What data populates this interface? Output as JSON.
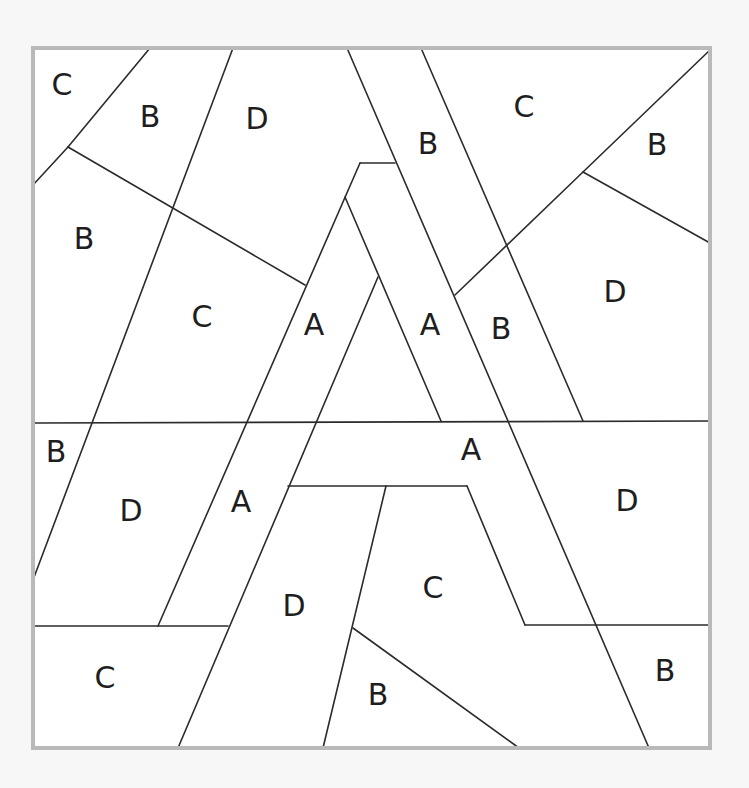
{
  "puzzle": {
    "title": "",
    "background": "#f7f7f7",
    "frame": {
      "x": 33,
      "y": 48,
      "width": 677,
      "height": 700,
      "fill": "#ffffff",
      "border_color": "#b9b9b9"
    },
    "line_color": "#2b2b2b",
    "segments": [
      [
        150,
        48,
        68,
        147
      ],
      [
        68,
        147,
        33,
        185
      ],
      [
        68,
        147,
        305,
        285
      ],
      [
        233,
        48,
        33,
        580
      ],
      [
        347,
        48,
        649,
        748
      ],
      [
        421,
        48,
        583,
        421
      ],
      [
        710,
        50,
        583,
        172
      ],
      [
        583,
        172,
        710,
        243
      ],
      [
        583,
        172,
        455,
        295
      ],
      [
        360,
        163,
        395,
        163
      ],
      [
        360,
        163,
        158,
        626
      ],
      [
        345,
        197,
        441,
        421
      ],
      [
        378,
        277,
        178,
        748
      ],
      [
        33,
        423,
        710,
        421
      ],
      [
        288,
        486,
        467,
        486
      ],
      [
        467,
        486,
        525,
        625
      ],
      [
        525,
        625,
        710,
        625
      ],
      [
        386,
        486,
        323,
        748
      ],
      [
        33,
        626,
        228,
        626
      ],
      [
        353,
        628,
        519,
        748
      ]
    ],
    "labels": [
      {
        "text": "C",
        "x": 62,
        "y": 84
      },
      {
        "text": "B",
        "x": 150,
        "y": 116
      },
      {
        "text": "D",
        "x": 257,
        "y": 118
      },
      {
        "text": "B",
        "x": 428,
        "y": 143
      },
      {
        "text": "C",
        "x": 524,
        "y": 106
      },
      {
        "text": "B",
        "x": 657,
        "y": 144
      },
      {
        "text": "B",
        "x": 84,
        "y": 238
      },
      {
        "text": "C",
        "x": 202,
        "y": 316
      },
      {
        "text": "A",
        "x": 314,
        "y": 324
      },
      {
        "text": "A",
        "x": 430,
        "y": 324
      },
      {
        "text": "B",
        "x": 501,
        "y": 328
      },
      {
        "text": "D",
        "x": 615,
        "y": 291
      },
      {
        "text": "B",
        "x": 56,
        "y": 451
      },
      {
        "text": "A",
        "x": 471,
        "y": 449
      },
      {
        "text": "D",
        "x": 131,
        "y": 510
      },
      {
        "text": "A",
        "x": 241,
        "y": 501
      },
      {
        "text": "D",
        "x": 627,
        "y": 500
      },
      {
        "text": "D",
        "x": 294,
        "y": 605
      },
      {
        "text": "C",
        "x": 433,
        "y": 587
      },
      {
        "text": "C",
        "x": 105,
        "y": 677
      },
      {
        "text": "B",
        "x": 378,
        "y": 694
      },
      {
        "text": "B",
        "x": 665,
        "y": 670
      }
    ]
  }
}
